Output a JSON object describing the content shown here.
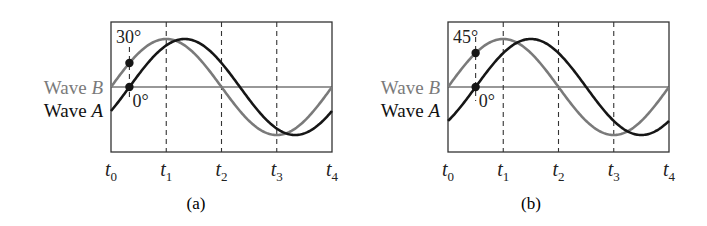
{
  "figure": {
    "panels": [
      {
        "caption": "(a)",
        "wave_b_label": "Wave",
        "wave_b_letter": "B",
        "wave_a_label": "Wave",
        "wave_a_letter": "A",
        "wave_b_angle_label": "30°",
        "wave_a_angle_label": "0°",
        "phase_lead_degrees": 30,
        "marker_phase_of_wave_a_degrees": 0,
        "ticks": [
          {
            "base": "t",
            "sub": "0"
          },
          {
            "base": "t",
            "sub": "1"
          },
          {
            "base": "t",
            "sub": "2"
          },
          {
            "base": "t",
            "sub": "3"
          },
          {
            "base": "t",
            "sub": "4"
          }
        ]
      },
      {
        "caption": "(b)",
        "wave_b_label": "Wave",
        "wave_b_letter": "B",
        "wave_a_label": "Wave",
        "wave_a_letter": "A",
        "wave_b_angle_label": "45°",
        "wave_a_angle_label": "0°",
        "phase_lead_degrees": 45,
        "marker_phase_of_wave_a_degrees": 0,
        "ticks": [
          {
            "base": "t",
            "sub": "0"
          },
          {
            "base": "t",
            "sub": "1"
          },
          {
            "base": "t",
            "sub": "2"
          },
          {
            "base": "t",
            "sub": "3"
          },
          {
            "base": "t",
            "sub": "4"
          }
        ]
      }
    ],
    "colors": {
      "wave_a": "#161616",
      "wave_b": "#7a7a7a",
      "frame": "#333333",
      "label_a": "#111111",
      "label_b": "#7a7a7a"
    }
  }
}
